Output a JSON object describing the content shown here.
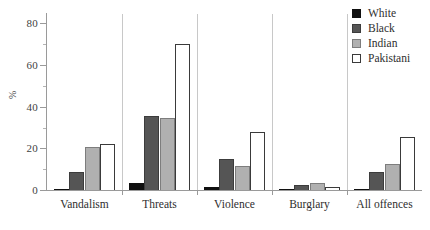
{
  "chart_data": {
    "type": "bar",
    "title": "",
    "subtitle": "",
    "xlabel": "",
    "ylabel": "%",
    "ylim": [
      0,
      85
    ],
    "yticks": [
      0,
      20,
      40,
      60,
      80
    ],
    "ytick_labels": [
      "0",
      "20",
      "40",
      "60",
      "80"
    ],
    "yminor_ticks": [
      10,
      30,
      50,
      70
    ],
    "grid": false,
    "legend_position": "top-right",
    "categories": [
      "Vandalism",
      "Threats",
      "Violence",
      "Burglary",
      "All offences"
    ],
    "series": [
      {
        "name": "White",
        "color": "#101010",
        "values": [
          1,
          4,
          2,
          0.5,
          1
        ]
      },
      {
        "name": "Black",
        "color": "#555555",
        "values": [
          9,
          36,
          15.5,
          3,
          9
        ]
      },
      {
        "name": "Indian",
        "color": "#b0b0b0",
        "values": [
          21,
          35,
          12,
          4,
          13
        ]
      },
      {
        "name": "Pakistani",
        "color": "#ffffff",
        "values": [
          22.5,
          70.5,
          28.5,
          2,
          26
        ]
      }
    ],
    "axis_color": "#9a9a9a",
    "separator_color": "#c8c8c8",
    "background": "#ffffff"
  },
  "legend": {
    "items": [
      {
        "label": "White"
      },
      {
        "label": "Black"
      },
      {
        "label": "Indian"
      },
      {
        "label": "Pakistani"
      }
    ]
  }
}
